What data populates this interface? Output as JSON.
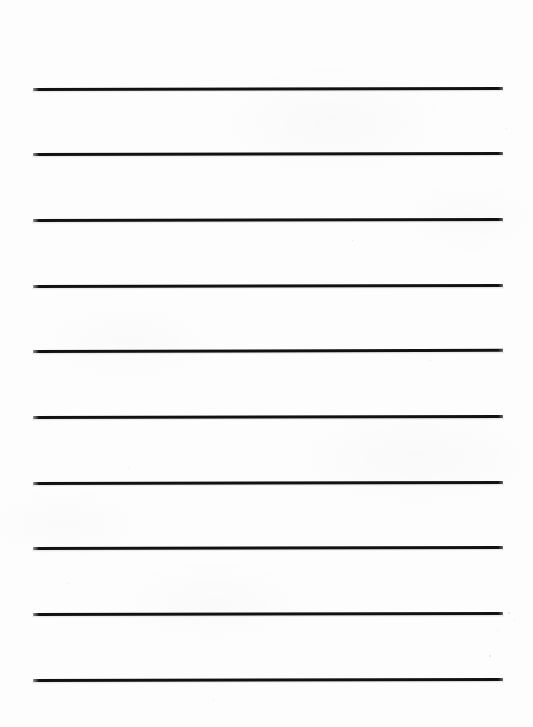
{
  "document": {
    "kind": "lined-writing-paper",
    "title": "Lined Writing Paper",
    "page_width": 533,
    "page_height": 727,
    "background_color": "#fdfdfd",
    "paper_orientation": "portrait",
    "has_text_content": false,
    "has_margin_rule": false,
    "line_count": 10
  },
  "ruling": {
    "line_color": "#121212",
    "line_thickness": 3,
    "line_left": 33,
    "line_right": 503,
    "line_width": 470,
    "line_spacing": 65.6,
    "tilt_degrees": -0.12,
    "lines": [
      {
        "index": 1,
        "y": 89,
        "tilt": -0.13
      },
      {
        "index": 2,
        "y": 154,
        "tilt": -0.12
      },
      {
        "index": 3,
        "y": 220,
        "tilt": -0.11
      },
      {
        "index": 4,
        "y": 286,
        "tilt": -0.12
      },
      {
        "index": 5,
        "y": 351,
        "tilt": -0.14
      },
      {
        "index": 6,
        "y": 417,
        "tilt": -0.11
      },
      {
        "index": 7,
        "y": 483,
        "tilt": -0.12
      },
      {
        "index": 8,
        "y": 548,
        "tilt": -0.13
      },
      {
        "index": 9,
        "y": 614,
        "tilt": -0.11
      },
      {
        "index": 10,
        "y": 680,
        "tilt": -0.12
      }
    ]
  },
  "specks": [
    {
      "x": 508,
      "y": 612,
      "size": 2
    },
    {
      "x": 514,
      "y": 620,
      "size": 1
    },
    {
      "x": 497,
      "y": 630,
      "size": 1
    },
    {
      "x": 489,
      "y": 655,
      "size": 2
    },
    {
      "x": 506,
      "y": 128,
      "size": 1
    },
    {
      "x": 128,
      "y": 468,
      "size": 1
    },
    {
      "x": 352,
      "y": 240,
      "size": 1
    },
    {
      "x": 67,
      "y": 583,
      "size": 1
    },
    {
      "x": 430,
      "y": 360,
      "size": 1
    },
    {
      "x": 213,
      "y": 700,
      "size": 1
    }
  ]
}
